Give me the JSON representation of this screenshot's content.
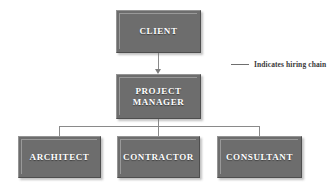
{
  "diagram": {
    "type": "organizational-hierarchy",
    "background_color": "#ffffff",
    "node_fill_color": "#6d6d6d",
    "node_text_color": "#ffffff",
    "connector_color": "#8a8a8a",
    "nodes": [
      {
        "id": "client",
        "label": "CLIENT",
        "level": 1
      },
      {
        "id": "manager",
        "label": "PROJECT\nMANAGER",
        "level": 2
      },
      {
        "id": "architect",
        "label": "ARCHITECT",
        "level": 3
      },
      {
        "id": "contractor",
        "label": "CONTRACTOR",
        "level": 3
      },
      {
        "id": "consultant",
        "label": "CONSULTANT",
        "level": 3
      }
    ],
    "edges": [
      {
        "from": "client",
        "to": "manager",
        "style": "arrow"
      },
      {
        "from": "manager",
        "to": "architect",
        "style": "line"
      },
      {
        "from": "manager",
        "to": "contractor",
        "style": "line"
      },
      {
        "from": "manager",
        "to": "consultant",
        "style": "line"
      }
    ]
  },
  "legend": {
    "label": "Indicates hiring chain",
    "line_color": "#6f6f6f"
  }
}
